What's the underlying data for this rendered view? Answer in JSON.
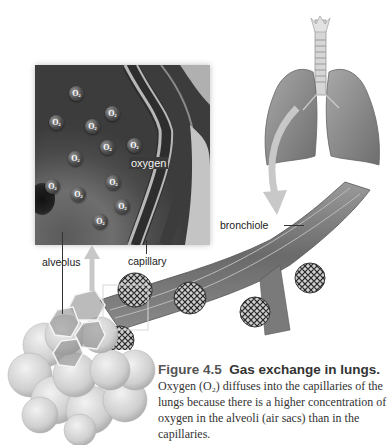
{
  "figure": {
    "number": "Figure 4.5",
    "title": "Gas exchange in lungs.",
    "caption_lines": [
      "Oxygen (O₂) diffuses into the capillaries of the",
      "lungs because there is a higher concentration of",
      "oxygen in the alveoli (air sacs) than in the",
      "capillaries."
    ]
  },
  "labels": {
    "oxygen": "oxygen",
    "bronchiole": "bronchiole",
    "alveolus": "alveolus",
    "capillary": "capillary"
  },
  "inset": {
    "molecule_label": "O",
    "molecule_subscript": "2",
    "molecules": [
      {
        "x": 76,
        "y": 93
      },
      {
        "x": 112,
        "y": 113
      },
      {
        "x": 56,
        "y": 122
      },
      {
        "x": 92,
        "y": 126
      },
      {
        "x": 107,
        "y": 147
      },
      {
        "x": 134,
        "y": 145
      },
      {
        "x": 75,
        "y": 158
      },
      {
        "x": 52,
        "y": 186
      },
      {
        "x": 113,
        "y": 182
      },
      {
        "x": 78,
        "y": 194
      },
      {
        "x": 122,
        "y": 206
      },
      {
        "x": 100,
        "y": 221
      }
    ]
  },
  "colors": {
    "inset_bg": "#5a5a5a",
    "membrane": "#b8b8b8",
    "lung": "#8c8c8c",
    "alveoli": "#d4d4d4",
    "text": "#333333"
  }
}
